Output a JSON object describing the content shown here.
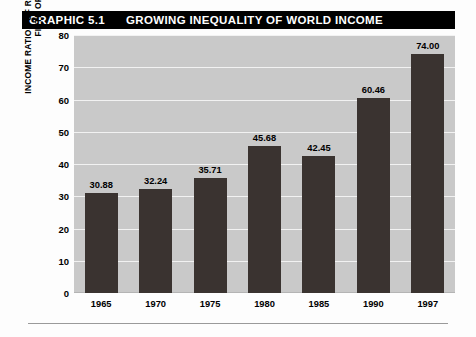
{
  "title": {
    "number": "GRAPHIC 5.1",
    "text": "GROWING INEQUALITY OF WORLD INCOME",
    "bar_color": "#000000",
    "text_color": "#ffffff"
  },
  "chart_data": {
    "type": "bar",
    "title": "GRAPHIC 5.1   GROWING INEQUALITY OF WORLD INCOME",
    "xlabel": "",
    "ylabel": "INCOME RATIOS OF RICHEST FIFTH TO POOREST FIFTH OF POPULATION",
    "ylabel_lines": [
      "INCOME RATIOS OF RICHEST FIFTH TO POOREST",
      "FIFTH OF POPULATION"
    ],
    "categories": [
      "1965",
      "1970",
      "1975",
      "1980",
      "1985",
      "1990",
      "1997"
    ],
    "values": [
      30.88,
      32.24,
      35.71,
      45.68,
      42.45,
      60.46,
      74.0
    ],
    "value_labels": [
      "30.88",
      "32.24",
      "35.71",
      "45.68",
      "42.45",
      "60.46",
      "74.00"
    ],
    "ylim": [
      0,
      80
    ],
    "yticks": [
      0,
      10,
      20,
      30,
      40,
      50,
      60,
      70,
      80
    ],
    "ytick_labels": [
      "0",
      "10",
      "20",
      "30",
      "40",
      "50",
      "60",
      "70",
      "80"
    ],
    "grid": true,
    "grid_color": "#f2f2f2",
    "legend": null,
    "bar_color": "#3a3330",
    "plot_background": "#c9c9c9"
  }
}
